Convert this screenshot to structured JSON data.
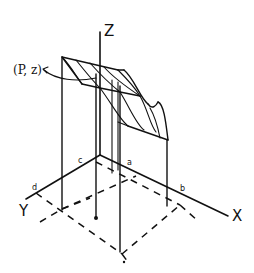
{
  "diagram": {
    "axes": {
      "x_label": "X",
      "y_label": "Y",
      "z_label": "Z"
    },
    "annotation": {
      "point_label": "(P, z)"
    },
    "base_points": {
      "a": "a",
      "b": "b",
      "c": "c",
      "d": "d"
    },
    "colors": {
      "line": "#111111",
      "background": "#ffffff"
    }
  }
}
